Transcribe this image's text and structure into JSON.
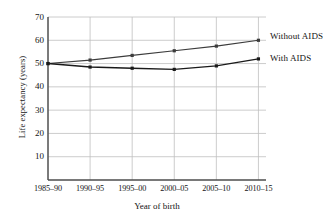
{
  "chart_data": {
    "type": "line",
    "title": "",
    "xlabel": "Year of birth",
    "ylabel": "Life expectancy (years)",
    "categories": [
      "1985–90",
      "1990–95",
      "1995–00",
      "2000–05",
      "2005–10",
      "2010–15"
    ],
    "ylim": [
      0,
      70
    ],
    "yticks": [
      10,
      20,
      30,
      40,
      50,
      60,
      70
    ],
    "ytick_labels": [
      "10",
      "20",
      "30",
      "40",
      "50",
      "60",
      "70"
    ],
    "grid": true,
    "legend_position": "right-inline",
    "series": [
      {
        "name": "Without AIDS",
        "color": "#3c3c3c",
        "values": [
          50,
          51.5,
          53.5,
          55.5,
          57.5,
          60
        ]
      },
      {
        "name": "With AIDS",
        "color": "#1a1a1a",
        "values": [
          50,
          48.5,
          48,
          47.5,
          49,
          52
        ]
      }
    ]
  },
  "axes": {
    "y_title": "Life expectancy (years)",
    "x_title": "Year of birth"
  },
  "colors": {
    "axis": "#4d4d4d",
    "grid": "#bfbfbf",
    "without_aids": "#3c3c3c",
    "with_aids": "#1a1a1a",
    "text": "#141414"
  }
}
